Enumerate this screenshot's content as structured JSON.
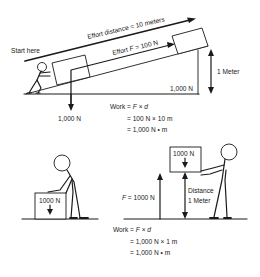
{
  "ramp_scenario": {
    "start_label": "Start here",
    "effort_distance_label": "Effort distance = 10 meters",
    "effort_force_prefix": "Effort ",
    "effort_force_var": "F",
    "effort_force_suffix": " = 100 N",
    "height_label": "1 Meter",
    "box_weight_on_ramp": "1,000 N",
    "downward_force_label": "1,000 N",
    "work_formula": {
      "line1_prefix": "Work = ",
      "line1_f": "F",
      "line1_op": " × ",
      "line1_d": "d",
      "line2": "= 100 N × 10 m",
      "line3": "= 1,000 N • m"
    }
  },
  "lift_scenario": {
    "box_on_ground_label": "1000 N",
    "lifted_box_label": "1000 N",
    "force_var": "F",
    "force_suffix": " = 1000 N",
    "distance_line1": "Distance",
    "distance_line2": "1 Meter",
    "work_formula": {
      "line1_prefix": "Work = ",
      "line1_f": "F",
      "line1_op": " × ",
      "line1_d": "d",
      "line2": "= 1,000 N × 1 m",
      "line3": "= 1,000 N • m"
    }
  },
  "colors": {
    "ink": "#1a1a1a",
    "background": "#ffffff"
  }
}
